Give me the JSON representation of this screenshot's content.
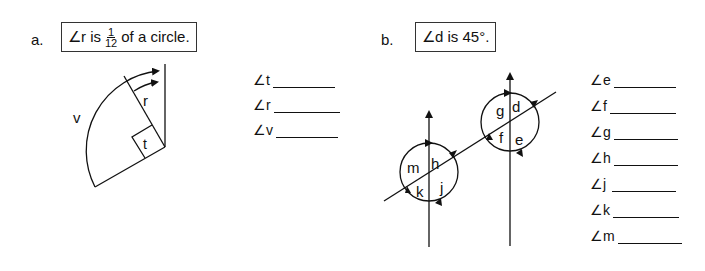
{
  "part_a": {
    "label": "a.",
    "given": {
      "prefix": "∠r is",
      "fraction_numerator": "1",
      "fraction_denominator": "12",
      "suffix": "of a circle."
    },
    "diagram_labels": {
      "r": "r",
      "t": "t",
      "v": "v"
    },
    "answers": [
      {
        "label": "∠t"
      },
      {
        "label": "∠r"
      },
      {
        "label": "∠v"
      }
    ]
  },
  "part_b": {
    "label": "b.",
    "given": {
      "text": "∠d is 45°."
    },
    "diagram_labels": {
      "d": "d",
      "e": "e",
      "f": "f",
      "g": "g",
      "h": "h",
      "j": "j",
      "k": "k",
      "m": "m"
    },
    "answers": [
      {
        "label": "∠e"
      },
      {
        "label": "∠f"
      },
      {
        "label": "∠g"
      },
      {
        "label": "∠h"
      },
      {
        "label": "∠j"
      },
      {
        "label": "∠k"
      },
      {
        "label": "∠m"
      }
    ]
  }
}
